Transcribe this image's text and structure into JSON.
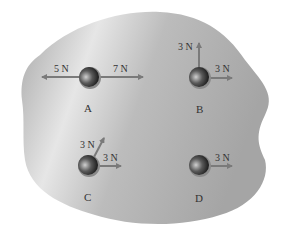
{
  "diagram": {
    "colors": {
      "surface_light": "#e4e4e4",
      "surface_dark": "#9f9f9f",
      "arrow": "#7a7a7a",
      "puck_dark": "#1e1e1e",
      "puck_light": "#bdbdbd",
      "text": "#333333"
    },
    "pucks": [
      {
        "id": "A",
        "label": "A",
        "forces": [
          {
            "magnitude_label": "5 N",
            "direction": "left"
          },
          {
            "magnitude_label": "7 N",
            "direction": "right"
          }
        ]
      },
      {
        "id": "B",
        "label": "B",
        "forces": [
          {
            "magnitude_label": "3 N",
            "direction": "up"
          },
          {
            "magnitude_label": "3 N",
            "direction": "right"
          }
        ]
      },
      {
        "id": "C",
        "label": "C",
        "forces": [
          {
            "magnitude_label": "3 N",
            "direction": "up-right"
          },
          {
            "magnitude_label": "3 N",
            "direction": "right"
          }
        ]
      },
      {
        "id": "D",
        "label": "D",
        "forces": [
          {
            "magnitude_label": "3 N",
            "direction": "right"
          }
        ]
      }
    ]
  }
}
